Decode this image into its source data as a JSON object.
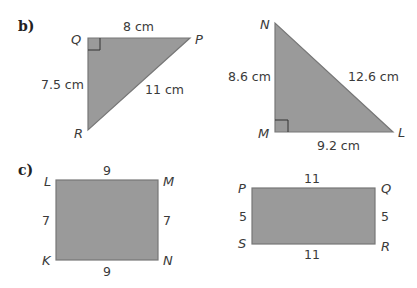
{
  "parts": [
    {
      "label": "b)",
      "shapes": [
        {
          "type": "right-triangle",
          "vertices": {
            "Q": "Q",
            "P": "P",
            "R": "R"
          },
          "right_angle_at": "Q",
          "sides": {
            "QP": "8 cm",
            "QR": "7.5 cm",
            "PR": "11 cm"
          }
        },
        {
          "type": "right-triangle",
          "vertices": {
            "N": "N",
            "M": "M",
            "L": "L"
          },
          "right_angle_at": "M",
          "sides": {
            "NM": "8.6 cm",
            "NL": "12.6 cm",
            "ML": "9.2 cm"
          }
        }
      ]
    },
    {
      "label": "c)",
      "shapes": [
        {
          "type": "rectangle",
          "vertices": {
            "L": "L",
            "M": "M",
            "N": "N",
            "K": "K"
          },
          "sides": {
            "top": "9",
            "bottom": "9",
            "left": "7",
            "right": "7"
          }
        },
        {
          "type": "rectangle",
          "vertices": {
            "P": "P",
            "Q": "Q",
            "R": "R",
            "S": "S"
          },
          "sides": {
            "top": "11",
            "bottom": "11",
            "left": "5",
            "right": "5"
          }
        }
      ]
    }
  ],
  "colors": {
    "fill": "#9a9a9a",
    "stroke": "#777777",
    "text": "#3a3a3a"
  }
}
